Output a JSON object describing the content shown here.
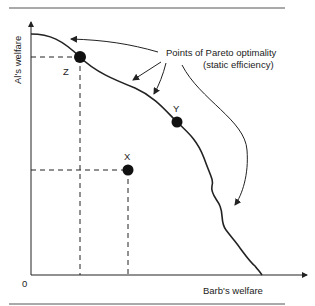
{
  "diagram": {
    "type": "pareto-frontier",
    "axes": {
      "x_label": "Barb's welfare",
      "y_label": "Al's welfare",
      "origin_label": "0"
    },
    "annotation": {
      "line1": "Points of Pareto optimality",
      "line2": "(static efficiency)"
    },
    "points": [
      {
        "id": "Z",
        "label": "Z",
        "on_frontier": true
      },
      {
        "id": "Y",
        "label": "Y",
        "on_frontier": true
      },
      {
        "id": "X",
        "label": "X",
        "on_frontier": false
      }
    ],
    "colors": {
      "ink": "#222222",
      "rule": "#555555",
      "background": "#ffffff"
    }
  }
}
